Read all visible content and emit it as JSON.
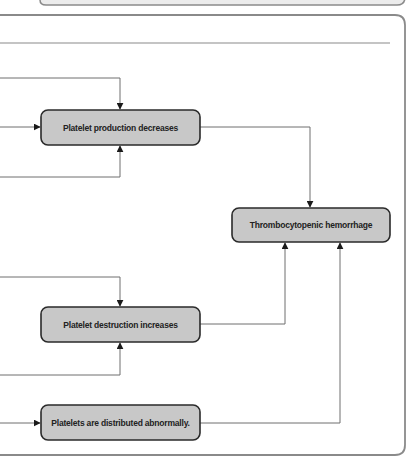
{
  "diagram": {
    "type": "flowchart",
    "nodes": [
      {
        "id": "production",
        "label": "Platelet production decreases"
      },
      {
        "id": "destruction",
        "label": "Platelet destruction increases"
      },
      {
        "id": "distribution",
        "label": "Platelets are distributed abnormally."
      },
      {
        "id": "hemorrhage",
        "label": "Thrombocytopenic hemorrhage"
      }
    ],
    "edges": [
      {
        "from": "production",
        "to": "hemorrhage"
      },
      {
        "from": "destruction",
        "to": "hemorrhage"
      },
      {
        "from": "distribution",
        "to": "hemorrhage"
      }
    ],
    "colors": {
      "box_fill": "#c8c8c8",
      "box_stroke": "#2a2a2a",
      "line": "#6e6e6e",
      "panel_border": "#8a8a8a",
      "arrow": "#1a1a1a"
    }
  }
}
